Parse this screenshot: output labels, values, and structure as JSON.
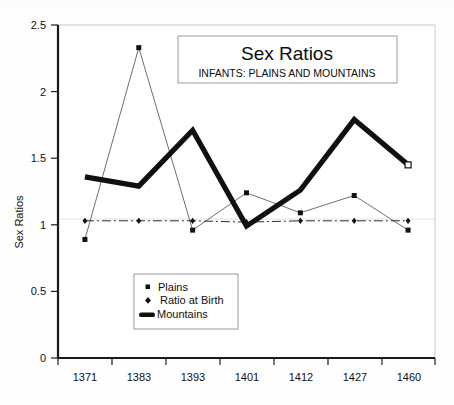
{
  "chart_data": {
    "type": "line",
    "title": "Sex Ratios",
    "subtitle": "INFANTS: PLAINS AND MOUNTAINS",
    "xlabel": "",
    "ylabel": "Sex Ratios",
    "categories": [
      "1371",
      "1383",
      "1393",
      "1401",
      "1412",
      "1427",
      "1460"
    ],
    "ylim": [
      0,
      2.5
    ],
    "yticks": [
      "0",
      "0.5",
      "1",
      "1.5",
      "2",
      "2.5"
    ],
    "ytick_values": [
      0,
      0.5,
      1,
      1.5,
      2,
      2.5
    ],
    "grid": false,
    "legend_position": "lower-left-inside",
    "series": [
      {
        "name": "Plains",
        "marker": "square",
        "line_width": "thin",
        "values": [
          0.89,
          2.33,
          0.96,
          1.24,
          1.09,
          1.22,
          0.96
        ]
      },
      {
        "name": "Ratio at Birth",
        "marker": "diamond",
        "line_width": "thin-dashdot",
        "values": [
          1.03,
          1.03,
          1.03,
          1.02,
          1.03,
          1.03,
          1.03
        ]
      },
      {
        "name": "Mountains",
        "marker": "none",
        "line_width": "thick",
        "values": [
          1.36,
          1.29,
          1.71,
          0.99,
          1.26,
          1.79,
          1.45
        ]
      }
    ]
  },
  "legend": {
    "items": [
      {
        "label": "Plains",
        "marker": "square"
      },
      {
        "label": "Ratio at Birth",
        "marker": "diamond"
      },
      {
        "label": "Mountains",
        "marker": "thick-line"
      }
    ]
  },
  "colors": {
    "ink": "#111111",
    "thin_line": "#6f6f6f",
    "thick_line": "#101010",
    "axis": "#1a1a1a",
    "plot_border": "#c9c9c9",
    "box_border": "#9a9a9a",
    "background": "#fefefe"
  }
}
